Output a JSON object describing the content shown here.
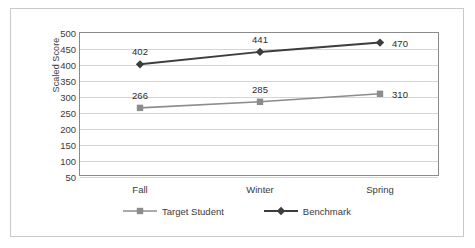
{
  "chart_data": {
    "type": "line",
    "title": "",
    "xlabel": "",
    "ylabel": "Scaled Score",
    "categories": [
      "Fall",
      "Winter",
      "Spring"
    ],
    "ylim": [
      50,
      500
    ],
    "ytick_step": 50,
    "yticks": [
      500,
      450,
      400,
      350,
      300,
      250,
      200,
      150,
      100,
      50
    ],
    "grid": true,
    "legend_position": "bottom",
    "series": [
      {
        "name": "Target Student",
        "values": [
          266,
          285,
          310
        ],
        "color": "#8c8c8c",
        "marker": "square"
      },
      {
        "name": "Benchmark",
        "values": [
          402,
          441,
          470
        ],
        "color": "#3d3d3d",
        "marker": "diamond"
      }
    ]
  }
}
